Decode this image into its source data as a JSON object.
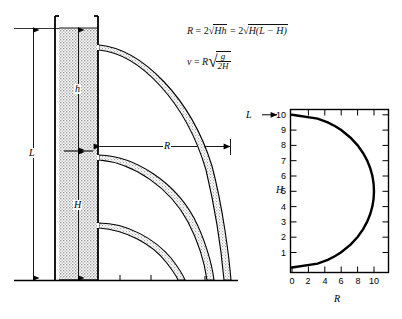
{
  "figure": {
    "title": "",
    "background": "#ffffff",
    "ink": "#000000",
    "tank_fill": "#d9d9d9"
  },
  "equations": {
    "range_eq": {
      "lhs": "R",
      "eq1": "=",
      "coef1": "2",
      "radical1": "Hh",
      "eq2": "=",
      "coef2": "2",
      "radical2": "H(L − H)",
      "plain": "R = 2√(Hh) = 2√(H(L − H))"
    },
    "velocity_eq": {
      "lhs": "v",
      "eq": "=",
      "factor": "R",
      "numerator": "g",
      "denominator": "2H",
      "plain": "v = R√(g / 2H)"
    }
  },
  "tank_diagram": {
    "dimension_L": "L",
    "dimension_h": "h",
    "dimension_H": "H",
    "range_dimension": "R",
    "jet_count": 3,
    "ground_tick_count": 6
  },
  "chart_data": {
    "type": "line",
    "title": "",
    "xlabel": "R",
    "ylabel": "H",
    "xlim": [
      0,
      11
    ],
    "ylim": [
      0,
      10.6
    ],
    "grid": false,
    "legend": null,
    "annotations": [
      {
        "text": "L →",
        "label": "L",
        "arrow": "→",
        "at_y": 10,
        "position": "left-of-axis"
      }
    ],
    "xticks": [
      0,
      2,
      4,
      6,
      8,
      10
    ],
    "xticklabels": [
      "0",
      "2",
      "4",
      "6",
      "8",
      "10"
    ],
    "yticks": [
      1,
      2,
      3,
      4,
      5,
      6,
      7,
      8,
      9,
      10
    ],
    "yticklabels": [
      "1",
      "2",
      "3",
      "4",
      "5",
      "6",
      "7",
      "8",
      "9",
      "10"
    ],
    "curve_description": "R = 2√(H(L−H)) with L = 10, semicircle of radius 5 centered at H=5",
    "series": [
      {
        "name": "R = 2√(H(L−H)), L=10",
        "H": [
          0,
          0.25,
          0.5,
          0.75,
          1,
          1.5,
          2,
          2.5,
          3,
          3.5,
          4,
          4.5,
          5,
          5.5,
          6,
          6.5,
          7,
          7.5,
          8,
          8.5,
          9,
          9.25,
          9.5,
          9.75,
          10
        ],
        "R": [
          0,
          3.12,
          4.36,
          5.27,
          6.0,
          7.14,
          8.0,
          8.66,
          9.17,
          9.54,
          9.8,
          9.95,
          10.0,
          9.95,
          9.8,
          9.54,
          9.17,
          8.66,
          8.0,
          7.14,
          6.0,
          5.27,
          4.36,
          3.12,
          0
        ]
      }
    ]
  }
}
